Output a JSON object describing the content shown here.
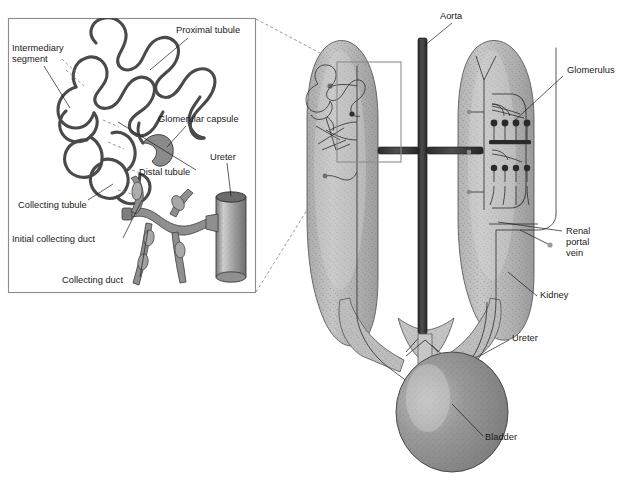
{
  "figure": {
    "background_color": "#ffffff"
  },
  "inset_panel": {
    "name": "nephron-detail-inset",
    "border_color": "#8c8c8c",
    "labels": [
      {
        "id": "proximal-tubule",
        "text": "Proximal tubule",
        "x": 176,
        "y": 33,
        "anchor": "start"
      },
      {
        "id": "intermediary-segment",
        "text": "Intermediary",
        "x": 12,
        "y": 51,
        "anchor": "start"
      },
      {
        "id": "intermediary-segment-2",
        "text": "segment",
        "x": 12,
        "y": 62,
        "anchor": "start"
      },
      {
        "id": "glomerular-capsule",
        "text": "Glomerular capsule",
        "x": 158,
        "y": 122,
        "anchor": "start"
      },
      {
        "id": "distal-tubule",
        "text": "Distal tubule",
        "x": 139,
        "y": 175,
        "anchor": "start"
      },
      {
        "id": "ureter-inset",
        "text": "Ureter",
        "x": 210,
        "y": 160,
        "anchor": "start"
      },
      {
        "id": "collecting-tubule",
        "text": "Collecting tubule",
        "x": 18,
        "y": 208,
        "anchor": "start"
      },
      {
        "id": "initial-collecting-duct",
        "text": "Initial collecting duct",
        "x": 12,
        "y": 242,
        "anchor": "start"
      },
      {
        "id": "collecting-duct",
        "text": "Collecting duct",
        "x": 62,
        "y": 283,
        "anchor": "start"
      }
    ]
  },
  "kidney_panel": {
    "name": "kidney-overview",
    "labels": [
      {
        "id": "aorta",
        "text": "Aorta",
        "x": 440,
        "y": 19,
        "anchor": "start"
      },
      {
        "id": "glomerulus",
        "text": "Glomerulus",
        "x": 567,
        "y": 73,
        "anchor": "start"
      },
      {
        "id": "renal-portal-vein",
        "text": "Renal",
        "x": 566,
        "y": 234,
        "anchor": "start"
      },
      {
        "id": "renal-portal-vein-2",
        "text": "portal",
        "x": 566,
        "y": 245,
        "anchor": "start"
      },
      {
        "id": "renal-portal-vein-3",
        "text": "vein",
        "x": 566,
        "y": 256,
        "anchor": "start"
      },
      {
        "id": "kidney",
        "text": "Kidney",
        "x": 540,
        "y": 298,
        "anchor": "start"
      },
      {
        "id": "ureter",
        "text": "Ureter",
        "x": 512,
        "y": 341,
        "anchor": "start"
      },
      {
        "id": "bladder",
        "text": "Bladder",
        "x": 485,
        "y": 440,
        "anchor": "start"
      }
    ],
    "colors": {
      "kidney_fill": "#b4b4b4",
      "kidney_stipple": "#7a7a7a",
      "bladder_fill": "#8a8a8a",
      "aorta": "#3a3a3a",
      "vessel": "#9a9a9a"
    }
  }
}
